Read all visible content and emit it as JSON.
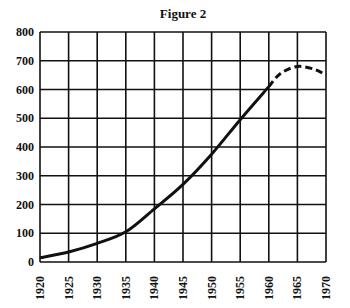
{
  "chart_data": {
    "type": "line",
    "title": "Figure 2",
    "xlabel": "",
    "ylabel": "",
    "xlim": [
      1920,
      1970
    ],
    "ylim": [
      0,
      800
    ],
    "grid": true,
    "x_ticks": [
      "1920",
      "1925",
      "1930",
      "1935",
      "1940",
      "1945",
      "1950",
      "1955",
      "1960",
      "1965",
      "1970"
    ],
    "y_ticks": [
      "0",
      "100",
      "200",
      "300",
      "400",
      "500",
      "600",
      "700",
      "800"
    ],
    "series": [
      {
        "name": "actual",
        "style": "solid",
        "x": [
          1920,
          1925,
          1930,
          1935,
          1940,
          1945,
          1950,
          1955,
          1960
        ],
        "values": [
          15,
          35,
          65,
          105,
          185,
          270,
          375,
          495,
          610
        ]
      },
      {
        "name": "projected",
        "style": "dashed",
        "x": [
          1960,
          1962,
          1965,
          1968,
          1970
        ],
        "values": [
          610,
          655,
          680,
          670,
          650
        ]
      }
    ]
  }
}
